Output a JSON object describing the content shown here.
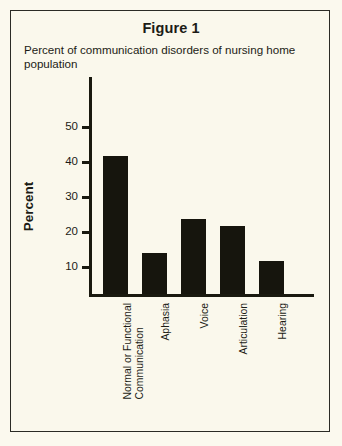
{
  "figure": {
    "title": "Figure 1",
    "subtitle": "Percent of communication disorders of nursing home population"
  },
  "axis": {
    "y_title": "Percent",
    "y_ticks": [
      "10",
      "20",
      "30",
      "40",
      "50"
    ]
  },
  "colors": {
    "background": "#faf8ec",
    "ink": "#1c1c16",
    "bar": "#16150d",
    "border": "#2b2b25"
  },
  "categories": {
    "c0_line1": "Normal or Functional",
    "c0_line2": "Communication",
    "c1": "Aphasia",
    "c2": "Voice",
    "c3": "Articulation",
    "c4": "Hearing"
  },
  "chart_data": {
    "type": "bar",
    "title": "Figure 1",
    "subtitle": "Percent of communication disorders of nursing home population",
    "xlabel": "",
    "ylabel": "Percent",
    "ylim": [
      0,
      57
    ],
    "yticks": [
      10,
      20,
      30,
      40,
      50
    ],
    "grid": false,
    "legend": false,
    "categories": [
      "Normal or Functional Communication",
      "Aphasia",
      "Voice",
      "Articulation",
      "Hearing"
    ],
    "values": [
      39.5,
      11.8,
      21.5,
      19.5,
      9.5
    ],
    "bar_color": "#16150d"
  }
}
